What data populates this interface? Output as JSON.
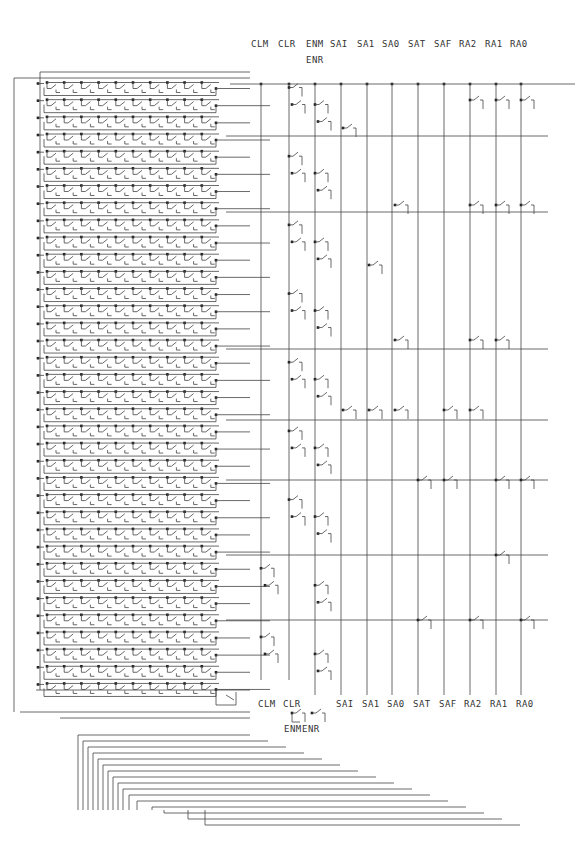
{
  "diagram": {
    "type": "relay-contact-tree-schematic",
    "grid": {
      "rows": 36,
      "contacts_per_row": 10
    },
    "top_labels": [
      {
        "text": "CLM",
        "x": 259
      },
      {
        "text": "CLR",
        "x": 286
      },
      {
        "text": "ENM",
        "x": 314
      },
      {
        "text": "SAI",
        "x": 338
      },
      {
        "text": "SA1",
        "x": 365
      },
      {
        "text": "SA0",
        "x": 390
      },
      {
        "text": "SAT",
        "x": 416
      },
      {
        "text": "SAF",
        "x": 442
      },
      {
        "text": "RA2",
        "x": 467
      },
      {
        "text": "RA1",
        "x": 493
      },
      {
        "text": "RA0",
        "x": 518
      }
    ],
    "top_sub_label": {
      "text": "ENR",
      "x": 314
    },
    "bottom_labels": [
      {
        "text": "CLM",
        "x": 266
      },
      {
        "text": "CLR",
        "x": 291
      },
      {
        "text": "SAI",
        "x": 344
      },
      {
        "text": "SA1",
        "x": 370
      },
      {
        "text": "SA0",
        "x": 395
      },
      {
        "text": "SAT",
        "x": 421
      },
      {
        "text": "SAF",
        "x": 447
      },
      {
        "text": "RA2",
        "x": 472
      },
      {
        "text": "RA1",
        "x": 498
      },
      {
        "text": "RA0",
        "x": 524
      }
    ],
    "bottom_sub_labels": [
      {
        "text": "ENM",
        "x": 292
      },
      {
        "text": "ENR",
        "x": 310
      }
    ]
  }
}
